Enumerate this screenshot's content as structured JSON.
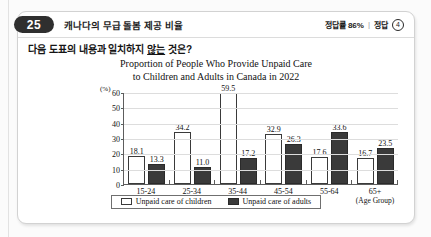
{
  "header": {
    "number": "25",
    "title": "캐나다의 무급 돌봄 제공 비율",
    "accuracy_label": "정답률 86%",
    "separator": "|",
    "answer_label": "정답",
    "answer_choice": "4"
  },
  "question": {
    "prefix": "다음 도표의 내용과 일치하지 ",
    "underlined": "않는",
    "suffix": " 것은?"
  },
  "chart_data": {
    "type": "bar",
    "title": "Proportion of People Who Provide Unpaid Care to Children and Adults in Canada in 2022",
    "title_line1": "Proportion of People Who Provide Unpaid Care",
    "title_line2": "to Children and Adults in Canada in 2022",
    "xlabel": "(Age Group)",
    "ylabel": "(%)",
    "ylim": [
      0,
      60
    ],
    "yticks": [
      0,
      10,
      20,
      30,
      40,
      50,
      60
    ],
    "grid": true,
    "legend_position": "bottom",
    "categories": [
      "15-24",
      "25-34",
      "35-44",
      "45-54",
      "55-64",
      "65+"
    ],
    "series": [
      {
        "name": "Unpaid care of children",
        "color": "#ffffff",
        "values": [
          18.1,
          34.2,
          59.5,
          32.9,
          17.6,
          16.7
        ]
      },
      {
        "name": "Unpaid care of adults",
        "color": "#3a3a3a",
        "values": [
          13.3,
          11.0,
          17.2,
          26.3,
          33.6,
          23.5
        ]
      }
    ]
  }
}
